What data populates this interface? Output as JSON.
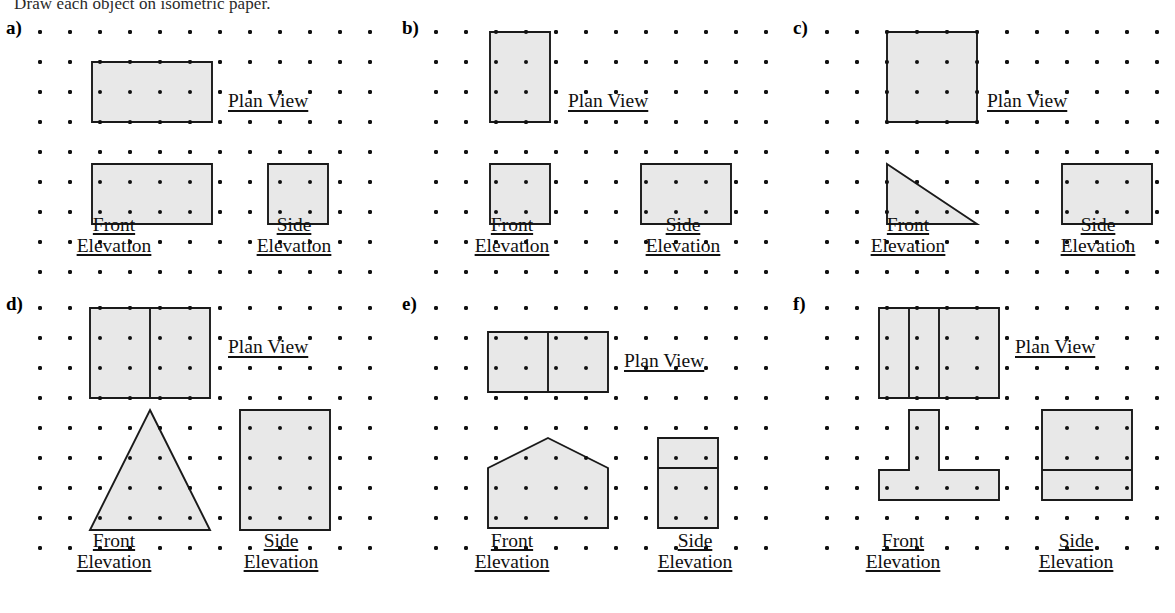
{
  "document": {
    "instruction": "Draw each object on isometric paper.",
    "labels": {
      "plan_view": "Plan View",
      "front": "Front",
      "side": "Side",
      "elevation": "Elevation"
    },
    "style": {
      "fill_color": "#e8e8e8",
      "stroke_color": "#1a1a1a",
      "dot_color": "#111111",
      "background": "#ffffff",
      "grid_spacing_px": 30,
      "dot_radius_px": 2
    }
  },
  "chart_data": {
    "type": "diagram",
    "title": "Draw each object on isometric paper.",
    "panels": [
      {
        "id": "a",
        "label": "a)",
        "plan": {
          "shape": "rectangle",
          "width_units": 4,
          "height_units": 2,
          "dividers": []
        },
        "front": {
          "shape": "rectangle",
          "width_units": 4,
          "height_units": 2,
          "dividers": []
        },
        "side": {
          "shape": "rectangle",
          "width_units": 2,
          "height_units": 2,
          "dividers": []
        }
      },
      {
        "id": "b",
        "label": "b)",
        "plan": {
          "shape": "rectangle",
          "width_units": 2,
          "height_units": 3,
          "dividers": []
        },
        "front": {
          "shape": "rectangle",
          "width_units": 2,
          "height_units": 2,
          "dividers": []
        },
        "side": {
          "shape": "rectangle",
          "width_units": 3,
          "height_units": 2,
          "dividers": []
        }
      },
      {
        "id": "c",
        "label": "c)",
        "plan": {
          "shape": "rectangle",
          "width_units": 3,
          "height_units": 3,
          "dividers": []
        },
        "front": {
          "shape": "right-triangle",
          "width_units": 3,
          "height_units": 2,
          "right_angle": "bottom-left"
        },
        "side": {
          "shape": "rectangle",
          "width_units": 3,
          "height_units": 2,
          "dividers": []
        }
      },
      {
        "id": "d",
        "label": "d)",
        "plan": {
          "shape": "rectangle",
          "width_units": 4,
          "height_units": 3,
          "dividers": [
            {
              "orientation": "vertical",
              "at_units": 2
            }
          ]
        },
        "front": {
          "shape": "isoceles-triangle",
          "width_units": 4,
          "height_units": 4
        },
        "side": {
          "shape": "rectangle",
          "width_units": 3,
          "height_units": 4,
          "dividers": []
        }
      },
      {
        "id": "e",
        "label": "e)",
        "plan": {
          "shape": "rectangle",
          "width_units": 4,
          "height_units": 2,
          "dividers": [
            {
              "orientation": "vertical",
              "at_units": 2
            }
          ]
        },
        "front": {
          "shape": "pentagon-house",
          "width_units": 4,
          "height_units": 3,
          "eaves_units": 1,
          "apex_x_units": 2
        },
        "side": {
          "shape": "rectangle",
          "width_units": 2,
          "height_units": 3,
          "dividers": [
            {
              "orientation": "horizontal",
              "at_units": 1
            }
          ]
        },
        "front_bottom_edge_units": 4
      },
      {
        "id": "f",
        "label": "f)",
        "plan": {
          "shape": "rectangle",
          "width_units": 4,
          "height_units": 3,
          "dividers": [
            {
              "orientation": "vertical",
              "at_units": 1
            },
            {
              "orientation": "vertical",
              "at_units": 2
            }
          ]
        },
        "front": {
          "shape": "tee",
          "width_units": 4,
          "height_units": 3,
          "stem_left_units": 1,
          "stem_right_units": 2,
          "base_height_units": 1
        },
        "side": {
          "shape": "rectangle",
          "width_units": 3,
          "height_units": 3,
          "dividers": [
            {
              "orientation": "horizontal",
              "at_units": 2
            }
          ]
        }
      }
    ]
  },
  "layout": {
    "panel_positions": [
      {
        "id": "a",
        "x": 0,
        "y": 14
      },
      {
        "id": "b",
        "x": 396,
        "y": 14
      },
      {
        "id": "c",
        "x": 787,
        "y": 14
      },
      {
        "id": "d",
        "x": 0,
        "y": 290
      },
      {
        "id": "e",
        "x": 396,
        "y": 290
      },
      {
        "id": "f",
        "x": 787,
        "y": 290
      }
    ]
  }
}
